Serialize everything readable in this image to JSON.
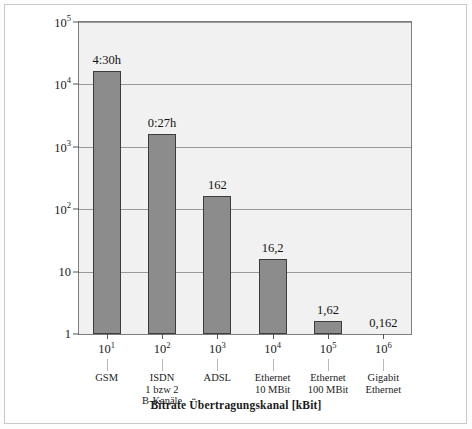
{
  "chart_data": {
    "type": "bar",
    "title": "",
    "xlabel": "Bitrate Übertragungskanal [kBit]",
    "ylabel": "Übertragungszeit [s]",
    "ylim": [
      1,
      100000
    ],
    "yscale": "log",
    "xscale": "log",
    "grid": true,
    "legend": "none",
    "categories": [
      "GSM",
      "ISDN 1 bzw 2 B-Kanäle",
      "ADSL",
      "Ethernet 10 MBit",
      "Ethernet 100 MBit",
      "Gigabit Ethernet"
    ],
    "x": [
      10,
      100,
      1000,
      10000,
      100000,
      1000000
    ],
    "values": [
      16200,
      1620,
      162,
      16.2,
      1.62,
      0.162
    ],
    "data_labels": [
      "4:30h",
      "0:27h",
      "162",
      "16,2",
      "1,62",
      "0,162"
    ],
    "y_ticks": [
      {
        "value": 100000,
        "mantissa": "10",
        "exponent": "5"
      },
      {
        "value": 10000,
        "mantissa": "10",
        "exponent": "4"
      },
      {
        "value": 1000,
        "mantissa": "10",
        "exponent": "3"
      },
      {
        "value": 100,
        "mantissa": "10",
        "exponent": "2"
      },
      {
        "value": 10,
        "mantissa": "10",
        "exponent": ""
      },
      {
        "value": 1,
        "mantissa": "1",
        "exponent": ""
      }
    ],
    "x_ticks": [
      {
        "value": 10,
        "mantissa": "10",
        "exponent": "1"
      },
      {
        "value": 100,
        "mantissa": "10",
        "exponent": "2"
      },
      {
        "value": 1000,
        "mantissa": "10",
        "exponent": "3"
      },
      {
        "value": 10000,
        "mantissa": "10",
        "exponent": "4"
      },
      {
        "value": 100000,
        "mantissa": "10",
        "exponent": "5"
      },
      {
        "value": 1000000,
        "mantissa": "10",
        "exponent": "6"
      }
    ],
    "category_lines": [
      [
        "GSM"
      ],
      [
        "ISDN",
        "1 bzw 2",
        "B-Kanäle"
      ],
      [
        "ADSL"
      ],
      [
        "Ethernet",
        "10 MBit"
      ],
      [
        "Ethernet",
        "100 MBit"
      ],
      [
        "Gigabit",
        "Ethernet"
      ]
    ],
    "colors": {
      "bar_fill": "#8c8c8c",
      "bar_border": "#3c3c3c",
      "plot_background": "#f1f1f1",
      "gridline": "#9a9a9a",
      "axis": "#7d7d7d",
      "text": "#1a1a1a"
    }
  }
}
